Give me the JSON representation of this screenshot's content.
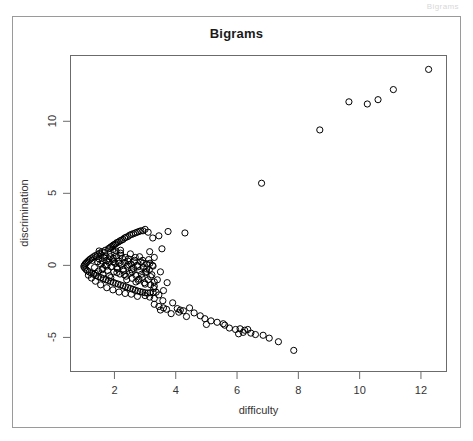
{
  "header_strip": {
    "text": "Bigrams"
  },
  "chart_data": {
    "type": "scatter",
    "title": "Bigrams",
    "xlabel": "difficulty",
    "ylabel": "discrimination",
    "xlim": [
      0.55,
      12.85
    ],
    "ylim": [
      -7.4,
      14.6
    ],
    "xticks": [
      2,
      4,
      6,
      8,
      10,
      12
    ],
    "yticks": [
      -5,
      0,
      5,
      10
    ],
    "grid": false,
    "legend": null,
    "marker": "open-circle",
    "marker_color": "#000000",
    "marker_size": 4.4,
    "points": [
      [
        12.25,
        13.6
      ],
      [
        11.1,
        12.2
      ],
      [
        10.6,
        11.5
      ],
      [
        10.25,
        11.2
      ],
      [
        9.65,
        11.35
      ],
      [
        8.7,
        9.4
      ],
      [
        6.8,
        5.7
      ],
      [
        4.3,
        2.25
      ],
      [
        3.75,
        2.35
      ],
      [
        3.45,
        2.05
      ],
      [
        3.25,
        1.9
      ],
      [
        3.1,
        2.3
      ],
      [
        3.0,
        2.5
      ],
      [
        2.93,
        2.4
      ],
      [
        2.86,
        2.4
      ],
      [
        2.8,
        2.35
      ],
      [
        2.74,
        2.3
      ],
      [
        2.68,
        2.25
      ],
      [
        2.62,
        2.2
      ],
      [
        2.56,
        2.15
      ],
      [
        2.5,
        2.1
      ],
      [
        2.44,
        2.0
      ],
      [
        2.38,
        1.95
      ],
      [
        2.33,
        1.9
      ],
      [
        2.28,
        1.8
      ],
      [
        2.23,
        1.75
      ],
      [
        2.18,
        1.7
      ],
      [
        2.13,
        1.62
      ],
      [
        2.08,
        1.58
      ],
      [
        2.04,
        1.5
      ],
      [
        2.0,
        1.45
      ],
      [
        1.96,
        1.4
      ],
      [
        1.92,
        1.32
      ],
      [
        1.88,
        1.28
      ],
      [
        1.84,
        1.2
      ],
      [
        3.55,
        1.15
      ],
      [
        3.15,
        0.95
      ],
      [
        3.3,
        0.55
      ],
      [
        2.2,
        1.05
      ],
      [
        2.05,
        1.0
      ],
      [
        1.95,
        1.1
      ],
      [
        1.8,
        1.15
      ],
      [
        1.7,
        1.05
      ],
      [
        1.6,
        0.95
      ],
      [
        1.52,
        0.85
      ],
      [
        1.45,
        0.75
      ],
      [
        1.38,
        0.68
      ],
      [
        1.32,
        0.6
      ],
      [
        1.27,
        0.52
      ],
      [
        1.22,
        0.45
      ],
      [
        1.18,
        0.38
      ],
      [
        1.14,
        0.3
      ],
      [
        1.1,
        0.22
      ],
      [
        1.07,
        0.15
      ],
      [
        1.04,
        0.08
      ],
      [
        1.02,
        0.0
      ],
      [
        1.0,
        -0.08
      ],
      [
        1.03,
        -0.18
      ],
      [
        1.07,
        -0.28
      ],
      [
        1.12,
        -0.38
      ],
      [
        1.18,
        -0.46
      ],
      [
        1.25,
        -0.55
      ],
      [
        1.32,
        -0.62
      ],
      [
        1.4,
        -0.7
      ],
      [
        1.48,
        -0.78
      ],
      [
        1.56,
        -0.85
      ],
      [
        1.64,
        -0.92
      ],
      [
        1.72,
        -1.0
      ],
      [
        1.8,
        -1.05
      ],
      [
        1.88,
        -1.12
      ],
      [
        1.96,
        -1.18
      ],
      [
        2.04,
        -1.25
      ],
      [
        2.12,
        -1.3
      ],
      [
        2.2,
        -1.36
      ],
      [
        2.28,
        -1.42
      ],
      [
        2.36,
        -1.48
      ],
      [
        2.44,
        -1.54
      ],
      [
        2.52,
        -1.6
      ],
      [
        2.6,
        -1.66
      ],
      [
        2.68,
        -1.72
      ],
      [
        2.76,
        -1.78
      ],
      [
        2.84,
        -1.82
      ],
      [
        2.92,
        -1.86
      ],
      [
        3.0,
        -1.9
      ],
      [
        3.08,
        -1.92
      ],
      [
        3.16,
        -1.9
      ],
      [
        3.26,
        -1.88
      ],
      [
        3.36,
        -1.86
      ],
      [
        1.45,
        0.25
      ],
      [
        1.5,
        0.45
      ],
      [
        1.55,
        0.1
      ],
      [
        1.6,
        0.3
      ],
      [
        1.62,
        -0.2
      ],
      [
        1.66,
        0.55
      ],
      [
        1.7,
        0.0
      ],
      [
        1.74,
        0.35
      ],
      [
        1.78,
        -0.35
      ],
      [
        1.82,
        0.2
      ],
      [
        1.86,
        0.6
      ],
      [
        1.9,
        -0.1
      ],
      [
        1.94,
        0.4
      ],
      [
        1.98,
        -0.45
      ],
      [
        2.02,
        0.15
      ],
      [
        2.06,
        0.65
      ],
      [
        2.1,
        -0.25
      ],
      [
        2.14,
        0.3
      ],
      [
        2.18,
        -0.6
      ],
      [
        2.22,
        0.05
      ],
      [
        2.26,
        0.5
      ],
      [
        2.3,
        -0.4
      ],
      [
        2.34,
        0.2
      ],
      [
        2.38,
        -0.75
      ],
      [
        2.42,
        -0.05
      ],
      [
        2.46,
        0.45
      ],
      [
        2.5,
        -0.55
      ],
      [
        2.54,
        0.1
      ],
      [
        2.58,
        -0.9
      ],
      [
        2.62,
        -0.2
      ],
      [
        2.66,
        0.35
      ],
      [
        2.7,
        -0.7
      ],
      [
        2.74,
        0.0
      ],
      [
        2.78,
        -1.05
      ],
      [
        2.82,
        -0.35
      ],
      [
        2.86,
        0.25
      ],
      [
        2.9,
        -0.85
      ],
      [
        2.94,
        -0.15
      ],
      [
        2.98,
        -1.2
      ],
      [
        3.02,
        -0.5
      ],
      [
        3.06,
        0.1
      ],
      [
        3.1,
        -1.0
      ],
      [
        3.14,
        -0.3
      ],
      [
        3.18,
        -1.35
      ],
      [
        3.22,
        -0.65
      ],
      [
        3.26,
        -0.05
      ],
      [
        3.3,
        -1.15
      ],
      [
        1.35,
        -0.15
      ],
      [
        1.42,
        0.6
      ],
      [
        1.48,
        -0.4
      ],
      [
        1.55,
        0.75
      ],
      [
        1.62,
        -0.62
      ],
      [
        1.68,
        0.88
      ],
      [
        1.75,
        -0.05
      ],
      [
        1.82,
        0.45
      ],
      [
        1.88,
        -0.85
      ],
      [
        1.95,
        0.25
      ],
      [
        2.0,
        0.9
      ],
      [
        2.08,
        -0.5
      ],
      [
        2.15,
        0.15
      ],
      [
        2.2,
        0.7
      ],
      [
        2.28,
        -0.28
      ],
      [
        2.35,
        0.55
      ],
      [
        2.4,
        -1.0
      ],
      [
        2.46,
        0.05
      ],
      [
        2.52,
        0.8
      ],
      [
        2.58,
        -0.45
      ],
      [
        2.64,
        0.25
      ],
      [
        2.7,
        -1.15
      ],
      [
        2.76,
        -0.1
      ],
      [
        2.82,
        0.6
      ],
      [
        2.88,
        -0.62
      ],
      [
        2.94,
        0.15
      ],
      [
        3.0,
        -1.3
      ],
      [
        3.05,
        -0.25
      ],
      [
        3.12,
        0.4
      ],
      [
        3.18,
        -0.78
      ],
      [
        3.24,
        0.0
      ],
      [
        3.3,
        -1.45
      ],
      [
        1.28,
        0.35
      ],
      [
        1.38,
        -0.55
      ],
      [
        1.5,
        1.0
      ],
      [
        1.6,
        -0.3
      ],
      [
        1.72,
        0.65
      ],
      [
        1.84,
        -0.72
      ],
      [
        1.96,
        0.5
      ],
      [
        2.08,
        -0.15
      ],
      [
        2.2,
        0.85
      ],
      [
        2.32,
        -0.65
      ],
      [
        2.44,
        0.3
      ],
      [
        2.56,
        -0.3
      ],
      [
        2.68,
        0.55
      ],
      [
        2.8,
        -0.95
      ],
      [
        2.92,
        0.35
      ],
      [
        3.04,
        -0.42
      ],
      [
        3.16,
        0.15
      ],
      [
        3.28,
        -1.6
      ],
      [
        3.4,
        -1.0
      ],
      [
        3.5,
        -0.45
      ],
      [
        3.6,
        -1.75
      ],
      [
        3.72,
        -1.2
      ],
      [
        3.0,
        -2.1
      ],
      [
        3.15,
        -2.2
      ],
      [
        3.3,
        -2.3
      ],
      [
        3.45,
        -2.05
      ],
      [
        3.58,
        -2.45
      ],
      [
        3.3,
        -2.7
      ],
      [
        3.45,
        -2.85
      ],
      [
        3.6,
        -2.95
      ],
      [
        3.5,
        -3.1
      ],
      [
        3.7,
        -3.05
      ],
      [
        3.9,
        -2.6
      ],
      [
        4.05,
        -3.0
      ],
      [
        4.15,
        -3.1
      ],
      [
        4.25,
        -3.15
      ],
      [
        4.1,
        -3.25
      ],
      [
        4.45,
        -2.95
      ],
      [
        4.8,
        -3.5
      ],
      [
        4.95,
        -3.7
      ],
      [
        5.15,
        -3.85
      ],
      [
        5.35,
        -3.95
      ],
      [
        5.0,
        -4.1
      ],
      [
        5.55,
        -4.05
      ],
      [
        5.75,
        -4.35
      ],
      [
        5.95,
        -4.45
      ],
      [
        6.1,
        -4.4
      ],
      [
        6.25,
        -4.5
      ],
      [
        6.35,
        -4.45
      ],
      [
        6.2,
        -4.65
      ],
      [
        6.45,
        -4.7
      ],
      [
        6.6,
        -4.8
      ],
      [
        6.85,
        -4.85
      ],
      [
        7.05,
        -5.05
      ],
      [
        7.35,
        -5.3
      ],
      [
        7.85,
        -5.9
      ],
      [
        4.6,
        -3.3
      ],
      [
        4.35,
        -3.55
      ],
      [
        5.6,
        -4.15
      ],
      [
        6.05,
        -4.75
      ],
      [
        3.85,
        -3.35
      ],
      [
        2.55,
        -2.0
      ],
      [
        2.75,
        -2.15
      ],
      [
        2.35,
        -1.95
      ],
      [
        2.15,
        -1.85
      ],
      [
        1.95,
        -1.7
      ],
      [
        1.75,
        -1.55
      ],
      [
        1.55,
        -1.35
      ],
      [
        1.38,
        -1.1
      ],
      [
        1.25,
        -0.88
      ],
      [
        1.15,
        -0.68
      ]
    ]
  }
}
